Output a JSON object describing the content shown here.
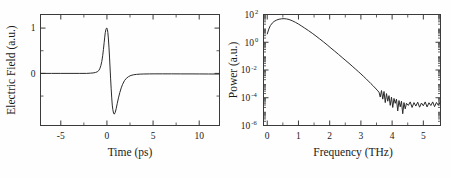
{
  "figure": {
    "background_color": "#ffffff",
    "curve_color": "#2b2b2b",
    "axis_color": "#3a3a3a",
    "panel_count": 2
  },
  "chart_data": [
    {
      "type": "line",
      "id": "terahertz-time-domain-waveform",
      "title": "",
      "xlabel": "Time (ps)",
      "ylabel": "Electric Field (a.u.)",
      "xlim": [
        -7.2,
        12.2
      ],
      "ylim": [
        -1.15,
        1.3
      ],
      "grid": false,
      "legend": null,
      "xticks": [
        -5,
        0,
        5,
        10
      ],
      "xtick_labels": [
        "-5",
        "0",
        "5",
        "10"
      ],
      "xticks_minor": [
        -7.5,
        -2.5,
        2.5,
        7.5,
        12.5
      ],
      "yticks": [
        1,
        0
      ],
      "ytick_labels": [
        "1",
        "0"
      ],
      "yticks_minor": [
        1.3,
        0.5,
        -0.5,
        -1.15
      ],
      "x": [
        -7.2,
        -6.0,
        -5.0,
        -4.0,
        -3.0,
        -2.2,
        -1.8,
        -1.5,
        -1.25,
        -1.05,
        -0.9,
        -0.78,
        -0.66,
        -0.56,
        -0.46,
        -0.38,
        -0.3,
        -0.24,
        -0.18,
        -0.12,
        -0.06,
        0.0,
        0.05,
        0.1,
        0.16,
        0.22,
        0.28,
        0.34,
        0.4,
        0.46,
        0.52,
        0.58,
        0.64,
        0.72,
        0.8,
        0.9,
        1.0,
        1.12,
        1.25,
        1.4,
        1.55,
        1.7,
        1.9,
        2.1,
        2.35,
        2.6,
        2.9,
        3.2,
        3.6,
        4.0,
        4.6,
        5.2,
        6.0,
        7.0,
        8.0,
        9.0,
        10.0,
        11.0,
        12.2
      ],
      "y": [
        0.0,
        0.0,
        0.0,
        0.0,
        0.0,
        0.0,
        0.005,
        0.01,
        0.02,
        0.035,
        0.06,
        0.1,
        0.17,
        0.26,
        0.39,
        0.53,
        0.68,
        0.8,
        0.9,
        0.96,
        0.995,
        1.0,
        0.97,
        0.9,
        0.76,
        0.58,
        0.36,
        0.12,
        -0.12,
        -0.34,
        -0.54,
        -0.7,
        -0.8,
        -0.88,
        -0.9,
        -0.86,
        -0.78,
        -0.66,
        -0.54,
        -0.42,
        -0.32,
        -0.24,
        -0.16,
        -0.11,
        -0.07,
        -0.045,
        -0.03,
        -0.022,
        -0.016,
        -0.013,
        -0.011,
        -0.01,
        -0.01,
        -0.01,
        -0.011,
        -0.011,
        -0.012,
        -0.013,
        -0.014
      ]
    },
    {
      "type": "line",
      "id": "terahertz-power-spectrum",
      "title": "",
      "xlabel": "Frequency (THz)",
      "ylabel": "Power (a.u.)",
      "xlim": [
        -0.12,
        5.55
      ],
      "ylim_log10": [
        -6,
        2
      ],
      "yscale": "log",
      "grid": false,
      "legend": null,
      "xticks": [
        0,
        1,
        2,
        3,
        4,
        5
      ],
      "xtick_labels": [
        "0",
        "1",
        "2",
        "3",
        "4",
        "5"
      ],
      "xticks_minor": [
        0.5,
        1.5,
        2.5,
        3.5,
        4.5
      ],
      "ytick_exponents": [
        2,
        0,
        -2,
        -4,
        -6
      ],
      "ytick_labels": [
        "10",
        "10",
        "10",
        "10",
        "10"
      ],
      "ytick_sup": [
        "2",
        "0",
        "-2",
        "-4",
        "-6"
      ],
      "x": [
        0.0,
        0.05,
        0.1,
        0.16,
        0.22,
        0.3,
        0.38,
        0.46,
        0.54,
        0.62,
        0.7,
        0.8,
        0.9,
        1.0,
        1.1,
        1.2,
        1.32,
        1.44,
        1.56,
        1.68,
        1.8,
        1.92,
        2.04,
        2.16,
        2.28,
        2.4,
        2.52,
        2.62,
        2.72,
        2.82,
        2.92,
        3.0,
        3.08,
        3.16,
        3.24,
        3.32,
        3.4,
        3.46,
        3.52,
        3.58,
        3.62,
        3.66,
        3.7,
        3.74,
        3.78,
        3.82,
        3.86,
        3.9,
        3.94,
        3.98,
        4.02,
        4.06,
        4.1,
        4.14,
        4.18,
        4.22,
        4.26,
        4.3,
        4.34,
        4.38,
        4.42,
        4.46,
        4.52,
        4.58,
        4.64,
        4.7,
        4.76,
        4.82,
        4.88,
        4.94,
        5.0,
        5.06,
        5.12,
        5.18,
        5.24,
        5.3,
        5.36,
        5.42,
        5.48,
        5.54
      ],
      "y_log10": [
        0.6,
        0.95,
        1.2,
        1.38,
        1.5,
        1.6,
        1.66,
        1.69,
        1.7,
        1.68,
        1.64,
        1.55,
        1.44,
        1.31,
        1.17,
        1.02,
        0.84,
        0.65,
        0.45,
        0.24,
        0.03,
        -0.19,
        -0.42,
        -0.64,
        -0.87,
        -1.1,
        -1.33,
        -1.52,
        -1.72,
        -1.92,
        -2.12,
        -2.28,
        -2.45,
        -2.62,
        -2.8,
        -2.98,
        -3.16,
        -3.3,
        -3.45,
        -3.6,
        -3.95,
        -3.48,
        -4.1,
        -3.55,
        -4.35,
        -3.7,
        -4.25,
        -3.85,
        -4.55,
        -3.95,
        -4.7,
        -4.05,
        -4.4,
        -4.1,
        -4.95,
        -4.2,
        -4.65,
        -4.25,
        -5.15,
        -4.35,
        -4.8,
        -4.4,
        -4.55,
        -4.3,
        -4.7,
        -4.35,
        -4.6,
        -4.32,
        -4.68,
        -4.38,
        -4.58,
        -4.3,
        -4.66,
        -4.36,
        -4.56,
        -4.3,
        -4.64,
        -4.34,
        -4.54,
        -4.32
      ]
    }
  ]
}
